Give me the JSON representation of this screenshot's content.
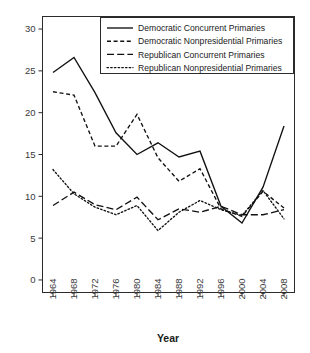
{
  "chart_data": {
    "type": "line",
    "title": "",
    "xlabel": "Year",
    "ylabel": "",
    "x": [
      1964,
      1968,
      1972,
      1976,
      1980,
      1984,
      1988,
      1992,
      1996,
      2000,
      2004,
      2008
    ],
    "categories": [
      "1964",
      "1968",
      "1972",
      "1976",
      "1980",
      "1984",
      "1988",
      "1992",
      "1996",
      "2000",
      "2004",
      "2008"
    ],
    "xlim": [
      1962,
      2010
    ],
    "ylim": [
      -1.5,
      31.5
    ],
    "yticks": [
      0,
      5,
      10,
      15,
      20,
      25,
      30
    ],
    "ytick_labels": [
      "0",
      "5",
      "10",
      "15",
      "20",
      "25",
      "30"
    ],
    "grid": false,
    "legend_position": "top-right",
    "series": [
      {
        "name": "Democratic Concurrent Primaries",
        "style": "solid",
        "values": [
          24.8,
          26.6,
          22.4,
          17.6,
          15.0,
          16.4,
          14.7,
          15.4,
          8.8,
          6.8,
          11.1,
          18.4
        ]
      },
      {
        "name": "Democratic Nonpresidential Primaries",
        "style": "dashed-short",
        "values": [
          22.5,
          22.1,
          16.0,
          16.0,
          19.8,
          14.6,
          11.8,
          13.3,
          8.5,
          7.6,
          10.6,
          8.6
        ]
      },
      {
        "name": "Republican Concurrent Primaries",
        "style": "dashed-long",
        "values": [
          8.9,
          10.5,
          9.0,
          8.4,
          9.9,
          7.2,
          8.5,
          8.1,
          8.8,
          7.8,
          7.8,
          8.4
        ]
      },
      {
        "name": "Republican Nonpresidential Primaries",
        "style": "dotted",
        "values": [
          13.2,
          10.3,
          8.7,
          7.8,
          8.9,
          5.9,
          8.1,
          9.5,
          8.4,
          7.7,
          10.7,
          7.3
        ]
      }
    ]
  },
  "legend": {
    "entries": [
      {
        "label": "Democratic Concurrent Primaries",
        "style": "solid"
      },
      {
        "label": "Democratic Nonpresidential Primaries",
        "style": "dashed-short"
      },
      {
        "label": "Republican Concurrent Primaries",
        "style": "dashed-long"
      },
      {
        "label": "Republican Nonpresidential Primaries",
        "style": "dotted"
      }
    ]
  },
  "colors": {
    "ink": "#111111",
    "frame": "#2b2b2b",
    "text": "#1a1a1a",
    "background": "#ffffff"
  }
}
